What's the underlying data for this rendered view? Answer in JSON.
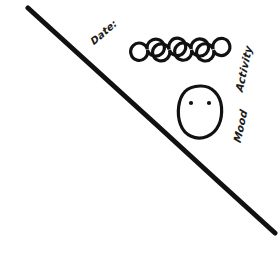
{
  "canvas": {
    "width": 278,
    "height": 262,
    "background_color": "#ffffff",
    "ink_color": "#111111"
  },
  "labels": {
    "date": "Date:",
    "activity": "Activity",
    "mood": "Mood"
  },
  "activity_trackers": {
    "count": 4,
    "shape": "circle",
    "filled": false,
    "items": [
      {
        "index": 1,
        "cx": 139,
        "cy": 50,
        "r": 8.5,
        "stroke_width": 3.2
      },
      {
        "index": 2,
        "cx": 161,
        "cy": 50,
        "r": 8.5,
        "stroke_width": 3.2
      },
      {
        "index": 3,
        "cx": 183,
        "cy": 50,
        "r": 8.5,
        "stroke_width": 3.2
      },
      {
        "index": 4,
        "cx": 205,
        "cy": 50,
        "r": 8.5,
        "stroke_width": 3.2
      }
    ]
  },
  "mood_face": {
    "expression": "neutral",
    "outline": {
      "cx": 200,
      "cy": 112,
      "rx": 21,
      "ry": 26,
      "stroke_width": 3.2
    },
    "eyes": [
      {
        "side": "left",
        "cx": 191,
        "cy": 103,
        "r": 2.1
      },
      {
        "side": "right",
        "cx": 209,
        "cy": 103,
        "r": 2.1
      }
    ],
    "mouth": null
  },
  "divider_line": {
    "orientation": "diagonal",
    "x1": 28,
    "y1": 8,
    "x2": 275,
    "y2": 233,
    "stroke_width": 5
  }
}
